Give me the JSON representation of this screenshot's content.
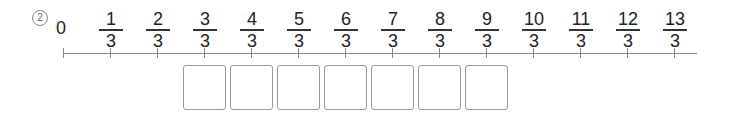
{
  "question_number": "2",
  "number_line": {
    "start_label": "0",
    "origin_x": 63,
    "spacing": 47,
    "ticks": [
      {
        "num": "1",
        "den": "3"
      },
      {
        "num": "2",
        "den": "3"
      },
      {
        "num": "3",
        "den": "3"
      },
      {
        "num": "4",
        "den": "3"
      },
      {
        "num": "5",
        "den": "3"
      },
      {
        "num": "6",
        "den": "3"
      },
      {
        "num": "7",
        "den": "3"
      },
      {
        "num": "8",
        "den": "3"
      },
      {
        "num": "9",
        "den": "3"
      },
      {
        "num": "10",
        "den": "3"
      },
      {
        "num": "11",
        "den": "3"
      },
      {
        "num": "12",
        "den": "3"
      },
      {
        "num": "13",
        "den": "3"
      }
    ]
  },
  "answer_boxes": {
    "count": 7,
    "under_fractions": [
      "3/3",
      "4/3",
      "5/3",
      "6/3",
      "7/3",
      "8/3",
      "9/3"
    ],
    "values": [
      "",
      "",
      "",
      "",
      "",
      "",
      ""
    ]
  }
}
